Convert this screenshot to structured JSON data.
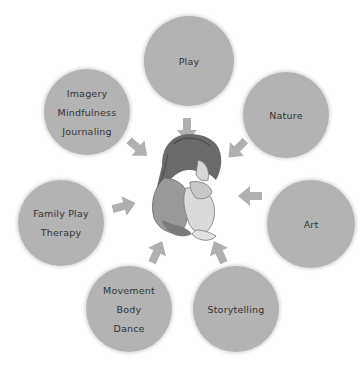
{
  "diagram": {
    "center": {
      "label": "child-figure",
      "description": "crouching child hugging knees"
    },
    "nodes": [
      {
        "id": "play",
        "lines": [
          "Play"
        ]
      },
      {
        "id": "nature",
        "lines": [
          "Nature"
        ]
      },
      {
        "id": "art",
        "lines": [
          "Art"
        ]
      },
      {
        "id": "storytelling",
        "lines": [
          "Storytelling"
        ]
      },
      {
        "id": "movement",
        "lines": [
          "Movement",
          "Body",
          "Dance"
        ]
      },
      {
        "id": "family",
        "lines": [
          "Family Play",
          "Therapy"
        ]
      },
      {
        "id": "imagery",
        "lines": [
          "Imagery",
          "Mindfulness",
          "Journaling"
        ]
      }
    ],
    "colors": {
      "circle": "#b3b3b3",
      "arrow": "#b0b0b0",
      "text": "#333333"
    }
  }
}
